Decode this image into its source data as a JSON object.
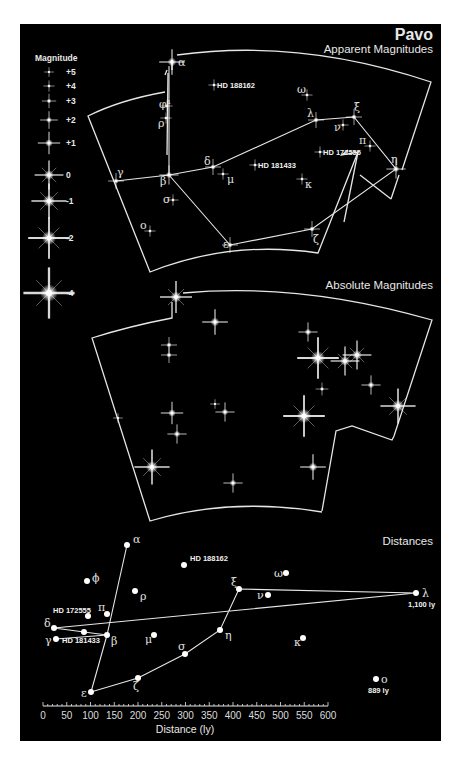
{
  "header": {
    "title": "Pavo",
    "subtitle_apparent": "Apparent Magnitudes",
    "subtitle_absolute": "Absolute Magnitudes",
    "subtitle_distances": "Distances"
  },
  "legend": {
    "title": "Magnitude",
    "entries": [
      {
        "label": "+5",
        "size": 3
      },
      {
        "label": "+4",
        "size": 3.5
      },
      {
        "label": "+3",
        "size": 4.5
      },
      {
        "label": "+2",
        "size": 5.5
      },
      {
        "label": "+1",
        "size": 7
      },
      {
        "label": "0",
        "size": 9
      },
      {
        "label": "-1",
        "size": 11
      },
      {
        "label": "-2",
        "size": 13
      },
      {
        "label": "-4",
        "size": 16
      }
    ]
  },
  "apparent_stars": [
    {
      "name": "α",
      "x": 172,
      "y": 62
    },
    {
      "name": "φ¹",
      "x": 167,
      "y": 106
    },
    {
      "name": "ρ",
      "x": 166,
      "y": 118
    },
    {
      "name": "γ",
      "x": 116,
      "y": 181
    },
    {
      "name": "β",
      "x": 169,
      "y": 175
    },
    {
      "name": "σ",
      "x": 173,
      "y": 200
    },
    {
      "name": "ο",
      "x": 150,
      "y": 231
    },
    {
      "name": "δ",
      "x": 213,
      "y": 167
    },
    {
      "name": "μ",
      "x": 223,
      "y": 174
    },
    {
      "name": "ε",
      "x": 230,
      "y": 245
    },
    {
      "name": "ζ",
      "x": 312,
      "y": 229
    },
    {
      "name": "η",
      "x": 396,
      "y": 169
    },
    {
      "name": "λ",
      "x": 316,
      "y": 120
    },
    {
      "name": "ξ",
      "x": 354,
      "y": 117
    },
    {
      "name": "ν",
      "x": 343,
      "y": 125
    },
    {
      "name": "π",
      "x": 370,
      "y": 146
    },
    {
      "name": "ω",
      "x": 307,
      "y": 95
    },
    {
      "name": "κ",
      "x": 302,
      "y": 179
    },
    {
      "name": "HD 188162",
      "x": 214,
      "y": 85
    },
    {
      "name": "HD 181433",
      "x": 255,
      "y": 165
    },
    {
      "name": "HD 172555",
      "x": 320,
      "y": 152
    }
  ],
  "absolute_stars": [
    {
      "x": 176,
      "y": 297,
      "r": 10
    },
    {
      "x": 215,
      "y": 322,
      "r": 8
    },
    {
      "x": 169,
      "y": 345,
      "r": 5
    },
    {
      "x": 169,
      "y": 355,
      "r": 5
    },
    {
      "x": 308,
      "y": 332,
      "r": 6
    },
    {
      "x": 318,
      "y": 358,
      "r": 13
    },
    {
      "x": 345,
      "y": 361,
      "r": 9
    },
    {
      "x": 357,
      "y": 355,
      "r": 9
    },
    {
      "x": 322,
      "y": 389,
      "r": 4
    },
    {
      "x": 371,
      "y": 385,
      "r": 6
    },
    {
      "x": 398,
      "y": 406,
      "r": 11
    },
    {
      "x": 304,
      "y": 416,
      "r": 13
    },
    {
      "x": 215,
      "y": 404,
      "r": 3
    },
    {
      "x": 225,
      "y": 412,
      "r": 6
    },
    {
      "x": 172,
      "y": 413,
      "r": 7
    },
    {
      "x": 177,
      "y": 434,
      "r": 6
    },
    {
      "x": 118,
      "y": 418,
      "r": 3
    },
    {
      "x": 152,
      "y": 467,
      "r": 11
    },
    {
      "x": 313,
      "y": 467,
      "r": 8
    },
    {
      "x": 233,
      "y": 483,
      "r": 6
    }
  ],
  "distance_stars": [
    {
      "name": "α",
      "ly": 180,
      "x": 127,
      "y": 545
    },
    {
      "name": "HD 188162",
      "ly": 300,
      "x": 184,
      "y": 565
    },
    {
      "name": "ϕ",
      "ly": 95,
      "x": 87,
      "y": 581
    },
    {
      "name": "ρ",
      "ly": 200,
      "x": 135,
      "y": 591
    },
    {
      "name": "HD 172555",
      "ly": 95,
      "x": 88,
      "y": 616
    },
    {
      "name": "π",
      "ly": 138,
      "x": 107,
      "y": 614
    },
    {
      "name": "δ",
      "ly": 20,
      "x": 54,
      "y": 628
    },
    {
      "name": "HD 181433",
      "ly": 87,
      "x": 84,
      "y": 632
    },
    {
      "name": "γ",
      "ly": 30,
      "x": 56,
      "y": 639
    },
    {
      "name": "β",
      "ly": 135,
      "x": 107,
      "y": 635
    },
    {
      "name": "μ",
      "ly": 235,
      "x": 154,
      "y": 635
    },
    {
      "name": "σ",
      "ly": 300,
      "x": 185,
      "y": 654
    },
    {
      "name": "η",
      "ly": 372,
      "x": 220,
      "y": 630
    },
    {
      "name": "ξ",
      "ly": 410,
      "x": 239,
      "y": 589
    },
    {
      "name": "ν",
      "ly": 475,
      "x": 268,
      "y": 595
    },
    {
      "name": "ω",
      "ly": 510,
      "x": 286,
      "y": 573
    },
    {
      "name": "κ",
      "ly": 550,
      "x": 303,
      "y": 638
    },
    {
      "name": "λ",
      "ly": 1100,
      "x": 416,
      "y": 593,
      "note": "1,100 ly"
    },
    {
      "name": "ο",
      "ly": 889,
      "x": 376,
      "y": 679,
      "note": "889 ly"
    },
    {
      "name": "ζ",
      "ly": 200,
      "x": 138,
      "y": 678
    },
    {
      "name": "ε",
      "ly": 100,
      "x": 91,
      "y": 692
    }
  ],
  "axis": {
    "label": "Distance (ly)",
    "ticks": [
      "0",
      "50",
      "100",
      "150",
      "200",
      "250",
      "300",
      "350",
      "400",
      "450",
      "500",
      "550",
      "600"
    ],
    "x0": 43,
    "x600": 328,
    "y": 706
  },
  "colors": {
    "background": "#000000",
    "page": "#ffffff",
    "lines": "#e6e6e6",
    "stars": "#ffffff"
  }
}
